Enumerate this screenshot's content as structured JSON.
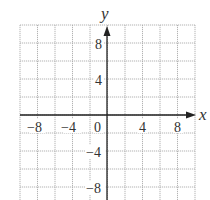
{
  "chart_data": {
    "type": "coordinate-grid",
    "title": "",
    "xlabel": "x",
    "ylabel": "y",
    "xlim": [
      -10,
      10
    ],
    "ylim": [
      -10,
      10
    ],
    "grid": true,
    "grid_step": 2,
    "x_tick_labels": [
      "-8",
      "-4",
      "0",
      "4",
      "8"
    ],
    "y_tick_labels": [
      "8",
      "4",
      "-4",
      "-8"
    ],
    "series": []
  },
  "labels": {
    "x_axis": "x",
    "y_axis": "y",
    "x_ticks": [
      {
        "text": "−8",
        "value": -8
      },
      {
        "text": "−4",
        "value": -4
      },
      {
        "text": "0",
        "value": 0
      },
      {
        "text": "4",
        "value": 4
      },
      {
        "text": "8",
        "value": 8
      }
    ],
    "y_ticks": [
      {
        "text": "8",
        "value": 8
      },
      {
        "text": "4",
        "value": 4
      },
      {
        "text": "−4",
        "value": -4
      },
      {
        "text": "−8",
        "value": -8
      }
    ]
  },
  "colors": {
    "grid": "#aaaaaa",
    "axis": "#222222",
    "text": "#333333"
  }
}
